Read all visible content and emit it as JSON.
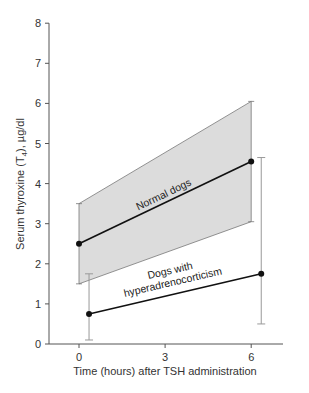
{
  "chart_data": {
    "type": "line",
    "title": "",
    "xlabel": "Time (hours) after TSH administration",
    "ylabel": "Serum thyroxine (T4), µg/dl",
    "ylabel_parts": {
      "pre": "Serum thyroxine (T",
      "sub": "4",
      "post": "), µg/dl"
    },
    "xlim": [
      -1,
      7.5
    ],
    "ylim": [
      0,
      8
    ],
    "xticks": [
      0,
      3,
      6
    ],
    "yticks": [
      0,
      1,
      2,
      3,
      4,
      5,
      6,
      7,
      8
    ],
    "grid": false,
    "series": [
      {
        "name": "Normal dogs",
        "x": [
          0,
          6
        ],
        "mean": [
          2.5,
          4.55
        ],
        "range_low": [
          1.5,
          3.05
        ],
        "range_high": [
          3.5,
          6.05
        ],
        "style": "shaded-range",
        "fill": "#dcdcdc"
      },
      {
        "name": "Dogs with hyperadrenocorticism",
        "label_lines": [
          "Dogs with",
          "hyperadrenocorticism"
        ],
        "x": [
          0.35,
          6.35
        ],
        "mean": [
          0.75,
          1.75
        ],
        "err_low": [
          0.1,
          0.5
        ],
        "err_high": [
          1.75,
          4.65
        ],
        "style": "error-bars"
      }
    ]
  },
  "colors": {
    "axis": "#555555",
    "line": "#111111",
    "band_fill": "#dcdcdc",
    "band_edge": "#777777",
    "errorbar": "#999999"
  }
}
